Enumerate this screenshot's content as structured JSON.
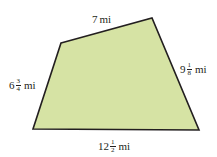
{
  "figure": {
    "type": "quadrilateral",
    "fill_color": "#d6e3a4",
    "stroke_color": "#231f20",
    "vertices": [
      [
        61,
        43
      ],
      [
        152,
        18
      ],
      [
        199,
        130
      ],
      [
        33,
        129
      ]
    ],
    "sides": {
      "top": {
        "whole": "7",
        "unit": "mi"
      },
      "right": {
        "whole": "9",
        "num": "1",
        "den": "8",
        "unit": "mi"
      },
      "bottom": {
        "whole": "12",
        "num": "1",
        "den": "2",
        "unit": "mi"
      },
      "left": {
        "whole": "6",
        "num": "3",
        "den": "4",
        "unit": "mi"
      }
    }
  }
}
